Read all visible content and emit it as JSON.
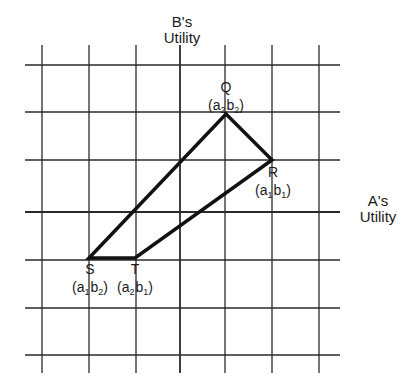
{
  "axes": {
    "vertical_title": [
      "B's",
      "Utility"
    ],
    "horizontal_title": [
      "A's",
      "Utility"
    ]
  },
  "grid": {
    "x_lines": [
      42,
      89,
      136,
      180,
      225,
      272,
      319
    ],
    "y_lines": [
      65,
      112,
      160,
      212,
      260,
      308,
      355
    ],
    "x_range": [
      25,
      340
    ],
    "y_range": [
      45,
      373
    ],
    "axis_x": 180,
    "axis_y": 212,
    "line_color": "#2a2a2a"
  },
  "polygon": {
    "stroke_color": "#111111",
    "vertices": [
      {
        "id": "Q",
        "x": 226,
        "y": 114,
        "label": "Q",
        "coord": {
          "a": "a",
          "a_sub": "2",
          "b": "b",
          "b_sub": "2"
        }
      },
      {
        "id": "R",
        "x": 272,
        "y": 160,
        "label": "R",
        "coord": {
          "a": "a",
          "a_sub": "1",
          "b": "b",
          "b_sub": "1"
        }
      },
      {
        "id": "T",
        "x": 135,
        "y": 258,
        "label": "T",
        "coord": {
          "a": "a",
          "a_sub": "2",
          "b": "b",
          "b_sub": "1"
        }
      },
      {
        "id": "S",
        "x": 89,
        "y": 258,
        "label": "S",
        "coord": {
          "a": "a",
          "a_sub": "1",
          "b": "b",
          "b_sub": "2"
        }
      }
    ]
  }
}
